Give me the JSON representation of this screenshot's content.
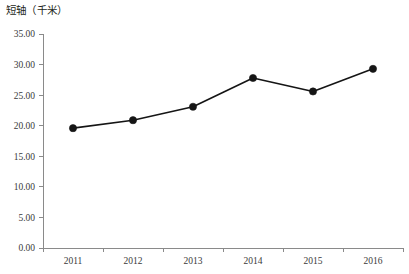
{
  "chart_data": {
    "type": "line",
    "title": "短轴（千米）",
    "xlabel": "",
    "ylabel": "短轴（千米）",
    "categories": [
      "2011",
      "2012",
      "2013",
      "2014",
      "2015",
      "2016"
    ],
    "values": [
      19.6,
      20.9,
      23.1,
      27.8,
      25.6,
      29.3
    ],
    "series": [
      {
        "name": "短轴",
        "values": [
          19.6,
          20.9,
          23.1,
          27.8,
          25.6,
          29.3
        ]
      }
    ],
    "ylim": [
      0.0,
      35.0
    ],
    "ytick_step": 5.0,
    "ytick_labels": [
      "0.00",
      "5.00",
      "10.00",
      "15.00",
      "20.00",
      "25.00",
      "30.00",
      "35.00"
    ],
    "ytick_values": [
      0,
      5,
      10,
      15,
      20,
      25,
      30,
      35
    ],
    "xtick_labels": [
      "2011",
      "2012",
      "2013",
      "2014",
      "2015",
      "2016"
    ],
    "grid": false,
    "legend": false,
    "legend_position": "none",
    "marker": "circle",
    "line_color": "#151515",
    "marker_color": "#151515",
    "axis_color": "#8a8a8a",
    "background_color": "#ffffff"
  }
}
